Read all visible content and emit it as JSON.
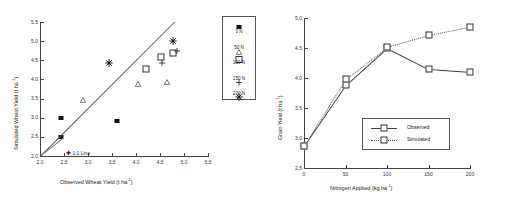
{
  "figure": {
    "panels": [
      "scatter-1to1",
      "nitrogen-response"
    ]
  },
  "left_panel": {
    "xlabel_main": "Observed Wheat Yield (t ha",
    "xlabel_sup": "-1",
    "xlabel_tail": ")",
    "ylabel_main": "Simulated Wheat Yield (t ha",
    "ylabel_sup": "-1",
    "ylabel_tail": ")",
    "annotation": "1:1 Line",
    "xticks": [
      "2.0",
      "2.5",
      "3.0",
      "3.5",
      "4.0",
      "4.5",
      "5.0",
      "5.5"
    ],
    "yticks": [
      "2.0",
      "2.5",
      "3.0",
      "3.5",
      "4.0",
      "4.5",
      "5.0",
      "5.5"
    ],
    "legend": [
      {
        "label": "0 N",
        "marker": "filled-square"
      },
      {
        "label": "50 N",
        "marker": "open-triangle"
      },
      {
        "label": "100 N",
        "marker": "open-square"
      },
      {
        "label": "150 N",
        "marker": "plus"
      },
      {
        "label": "200 N",
        "marker": "asterisk"
      }
    ]
  },
  "right_panel": {
    "xlabel_main": "Nitrogen Applied (kg ha",
    "xlabel_sup": "-1",
    "xlabel_tail": ")",
    "ylabel_main": "Grain Yield (t ha",
    "ylabel_sup": "-1",
    "ylabel_tail": ")",
    "xticks": [
      "0",
      "50",
      "100",
      "150",
      "200"
    ],
    "yticks": [
      "2.5",
      "3.0",
      "3.5",
      "4.0",
      "4.5",
      "5.0"
    ],
    "legend": [
      {
        "label": "Observed",
        "style": "solid",
        "marker": "open-square"
      },
      {
        "label": "Simulated",
        "style": "dotted",
        "marker": "open-square"
      }
    ]
  },
  "chart_data": [
    {
      "type": "scatter",
      "title": "",
      "xlabel": "Observed Wheat Yield (t ha-1)",
      "ylabel": "Simulated Wheat Yield (t ha-1)",
      "xlim": [
        2.0,
        5.5
      ],
      "ylim": [
        2.0,
        5.5
      ],
      "xticks": [
        2.0,
        2.5,
        3.0,
        3.5,
        4.0,
        4.5,
        5.0,
        5.5
      ],
      "yticks": [
        2.0,
        2.5,
        3.0,
        3.5,
        4.0,
        4.5,
        5.0,
        5.5
      ],
      "grid": false,
      "legend_position": "right-outside",
      "reference_line": {
        "label": "1:1 Line",
        "from": [
          2.0,
          2.0
        ],
        "to": [
          5.5,
          5.5
        ]
      },
      "series": [
        {
          "name": "0 N",
          "marker": "filled-square",
          "points": [
            [
              2.44,
              2.99
            ],
            [
              2.43,
              2.49
            ],
            [
              3.6,
              2.92
            ]
          ]
        },
        {
          "name": "50 N",
          "marker": "open-triangle",
          "points": [
            [
              2.9,
              3.67
            ],
            [
              4.04,
              4.08
            ],
            [
              4.65,
              4.14
            ]
          ]
        },
        {
          "name": "100 N",
          "marker": "open-square",
          "points": [
            [
              4.21,
              4.27
            ],
            [
              4.53,
              4.59
            ],
            [
              4.78,
              4.7
            ]
          ]
        },
        {
          "name": "150 N",
          "marker": "plus",
          "points": [
            [
              4.54,
              4.6
            ],
            [
              4.86,
              4.93
            ]
          ]
        },
        {
          "name": "200 N",
          "marker": "asterisk",
          "points": [
            [
              3.44,
              4.59
            ],
            [
              4.78,
              5.15
            ]
          ]
        }
      ]
    },
    {
      "type": "line",
      "title": "",
      "xlabel": "Nitrogen Applied (kg ha-1)",
      "ylabel": "Grain Yield (t ha-1)",
      "x": [
        0,
        50,
        100,
        150,
        200
      ],
      "xlim": [
        0,
        200
      ],
      "ylim": [
        2.5,
        5.0
      ],
      "xticks": [
        0,
        50,
        100,
        150,
        200
      ],
      "yticks": [
        2.5,
        3.0,
        3.5,
        4.0,
        4.5,
        5.0
      ],
      "grid": false,
      "legend_position": "lower-right-inside",
      "series": [
        {
          "name": "Observed",
          "style": "solid",
          "marker": "open-square",
          "values": [
            2.87,
            3.88,
            4.5,
            4.15,
            4.1
          ]
        },
        {
          "name": "Simulated",
          "style": "dotted",
          "marker": "open-square",
          "values": [
            2.87,
            3.98,
            4.51,
            4.71,
            4.85
          ]
        }
      ]
    }
  ]
}
